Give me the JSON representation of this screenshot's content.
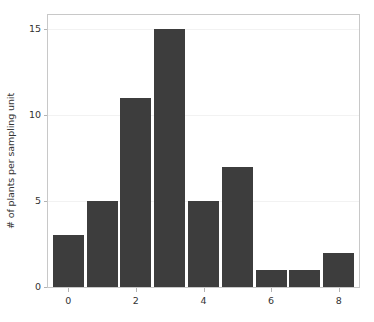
{
  "chart_data": {
    "type": "bar",
    "title": "",
    "subtitle": "",
    "xlabel": "",
    "ylabel": "# of plants per sampling unit",
    "categories": [
      "0",
      "1",
      "2",
      "3",
      "4",
      "5",
      "6",
      "7",
      "8"
    ],
    "values": [
      3,
      5,
      11,
      15,
      5,
      7,
      1,
      1,
      2
    ],
    "series": [
      {
        "name": "# of plants per sampling unit",
        "values": [
          3,
          5,
          11,
          15,
          5,
          7,
          1,
          1,
          2
        ]
      }
    ],
    "xlim": [
      -0.6,
      8.6
    ],
    "ylim": [
      0,
      15.8
    ],
    "yticks": [
      0,
      5,
      10,
      15
    ],
    "ytick_labels": [
      "0",
      "5",
      "10",
      "15"
    ],
    "xticks": [
      0,
      2,
      4,
      6,
      8
    ],
    "xtick_labels": [
      "0",
      "2",
      "4",
      "6",
      "8"
    ],
    "grid": true,
    "grid_axis": "y",
    "legend": false,
    "legend_position": "none",
    "bar_color": "#3d3d3d",
    "frame_color": "#c8c8c8",
    "gridline_color": "#f2f2f2",
    "text_color": "#333333",
    "background_color": "#ffffff"
  }
}
